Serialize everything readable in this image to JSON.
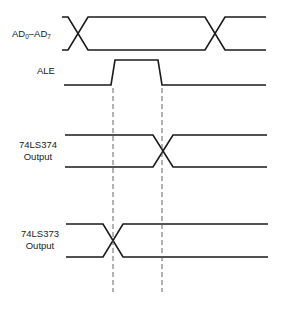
{
  "diagram": {
    "type": "timing-diagram",
    "signals": [
      {
        "id": "ad",
        "label_main": "AD",
        "label_sub0": "0",
        "label_sep": "–AD",
        "label_sub1": "7",
        "kind": "bus",
        "transitions_x": [
          82,
          215
        ]
      },
      {
        "id": "ale",
        "label": "ALE",
        "kind": "pulse",
        "rise_x": 113,
        "fall_x": 161
      },
      {
        "id": "ls374",
        "label_line1": "74LS374",
        "label_line2": "Output",
        "kind": "bus",
        "transitions_x": [
          163
        ]
      },
      {
        "id": "ls373",
        "label_line1": "74LS373",
        "label_line2": "Output",
        "kind": "bus",
        "transitions_x": [
          113
        ]
      }
    ],
    "reference_lines_x": [
      113,
      163
    ],
    "colors": {
      "line": "#1a1a1a",
      "dashed": "#555555",
      "background": "#ffffff"
    }
  }
}
